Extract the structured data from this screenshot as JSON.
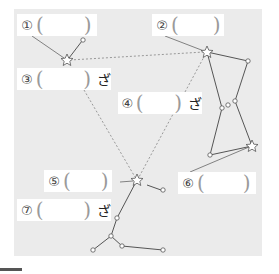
{
  "diagram": {
    "title": "",
    "panel_color": "#ebebeb",
    "labels": [
      {
        "id": "1",
        "number": "①",
        "open": "(",
        "close": ")",
        "suffix": ""
      },
      {
        "id": "2",
        "number": "②",
        "open": "(",
        "close": ")",
        "suffix": ""
      },
      {
        "id": "3",
        "number": "③",
        "open": "(",
        "close": ")",
        "suffix": "ざ"
      },
      {
        "id": "4",
        "number": "④",
        "open": "(",
        "close": ")",
        "suffix": "ざ"
      },
      {
        "id": "5",
        "number": "⑤",
        "open": "(",
        "close": ")",
        "suffix": ""
      },
      {
        "id": "6",
        "number": "⑥",
        "open": "(",
        "close": ")",
        "suffix": ""
      },
      {
        "id": "7",
        "number": "⑦",
        "open": "(",
        "close": ")",
        "suffix": "ざ"
      }
    ],
    "stars": [
      {
        "name": "star-top-left",
        "x": 67,
        "y": 60
      },
      {
        "name": "star-top-right",
        "x": 207,
        "y": 52
      },
      {
        "name": "star-lower-right",
        "x": 252,
        "y": 146
      },
      {
        "name": "star-bottom-center",
        "x": 137,
        "y": 180
      }
    ]
  }
}
